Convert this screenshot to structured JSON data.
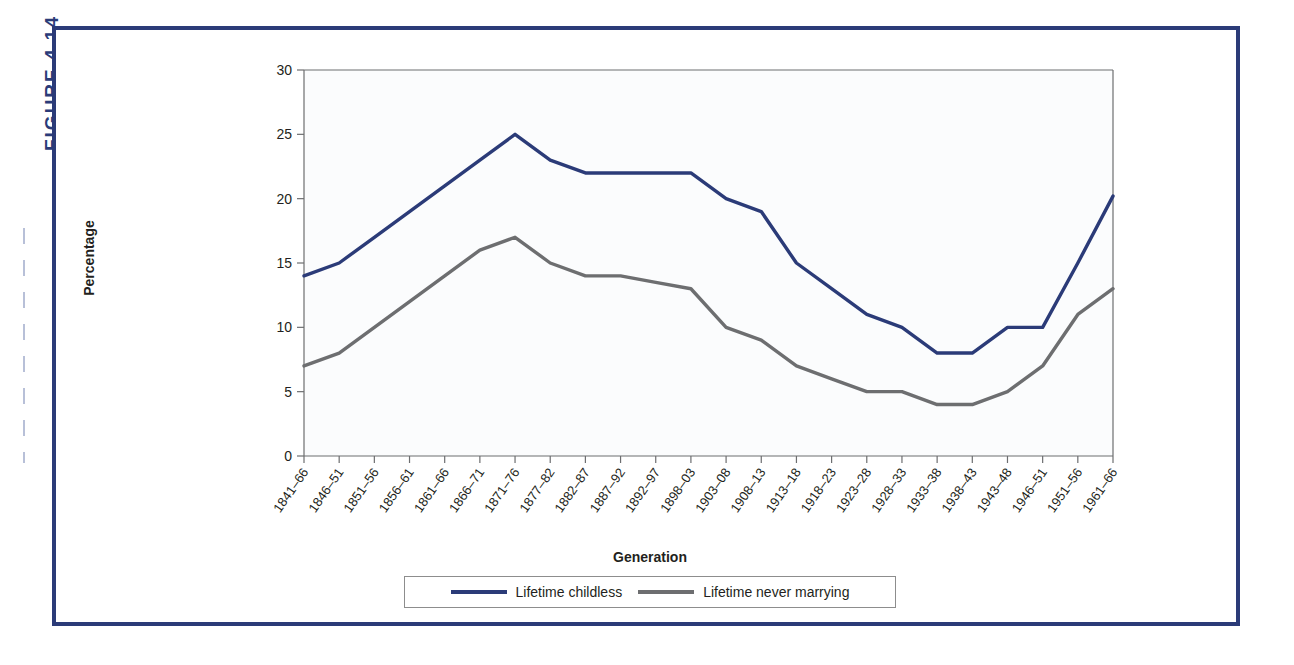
{
  "figure": {
    "label": "FIGURE 4.14",
    "frame_color": "#2b3b78"
  },
  "chart_data": {
    "type": "line",
    "title": "",
    "xlabel": "Generation",
    "ylabel": "Percentage",
    "ylim": [
      0,
      30
    ],
    "yticks": [
      0,
      5,
      10,
      15,
      20,
      25,
      30
    ],
    "grid": false,
    "legend_position": "bottom",
    "categories": [
      "1841–66",
      "1846–51",
      "1851–56",
      "1856–61",
      "1861–66",
      "1866–71",
      "1871–76",
      "1877–82",
      "1882–87",
      "1887–92",
      "1892–97",
      "1898–03",
      "1903–08",
      "1908–13",
      "1913–18",
      "1918–23",
      "1923–28",
      "1928–33",
      "1933–38",
      "1938–43",
      "1943–48",
      "1946–51",
      "1951–56",
      "1961–66"
    ],
    "series": [
      {
        "name": "Lifetime childless",
        "color": "#2b3b78",
        "values": [
          14,
          15,
          17,
          19,
          21,
          23,
          25,
          23,
          22,
          22,
          22,
          22,
          20,
          19,
          15,
          13,
          11,
          10,
          8,
          8,
          10,
          10,
          15,
          20.2
        ]
      },
      {
        "name": "Lifetime never marrying",
        "color": "#6d6e70",
        "values": [
          7,
          8,
          10,
          12,
          14,
          16,
          17,
          15,
          14,
          14,
          13.5,
          13,
          10,
          9,
          7,
          6,
          5,
          5,
          4,
          4,
          5,
          7,
          11,
          13
        ]
      }
    ]
  },
  "legend": {
    "entries": [
      {
        "label": "Lifetime childless",
        "color": "#2b3b78"
      },
      {
        "label": "Lifetime never marrying",
        "color": "#6d6e70"
      }
    ]
  }
}
